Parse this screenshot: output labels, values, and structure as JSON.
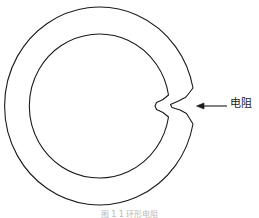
{
  "figure": {
    "background_color": "#ffffff",
    "stroke_color": "#1a1a1a",
    "stroke_width": 1.1,
    "caption": "图 1 1  环形电阻",
    "caption_color": "#b9b9b9"
  },
  "annotation": {
    "label": "电阻",
    "label_color": "#1a1a1a",
    "arrow_name": "leader-arrow-left",
    "arrow_from_x": 227,
    "arrow_to_x": 197,
    "arrow_y": 106
  },
  "shape": {
    "name": "split-ring-with-resistive-gap",
    "outer_center_x": 100,
    "outer_center_y": 106,
    "outer_radius_x": 95,
    "outer_radius_y": 99,
    "inner_radius_x": 70,
    "inner_radius_y": 72,
    "gap_angle_deg": 0,
    "gap_position": "right"
  }
}
